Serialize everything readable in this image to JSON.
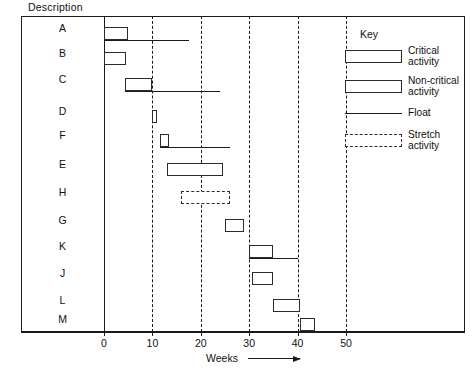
{
  "header": {
    "description_label": "Description"
  },
  "axis": {
    "x_title": "Weeks",
    "ticks": [
      {
        "value": 0,
        "label": "0"
      },
      {
        "value": 10,
        "label": "10"
      },
      {
        "value": 20,
        "label": "20"
      },
      {
        "value": 30,
        "label": "30"
      },
      {
        "value": 40,
        "label": "40"
      },
      {
        "value": 50,
        "label": "50"
      }
    ]
  },
  "key": {
    "title": "Key",
    "items": [
      {
        "type": "critical",
        "label": "Critical\nactivity"
      },
      {
        "type": "non-critical",
        "label": "Non-critical\nactivity"
      },
      {
        "type": "float",
        "label": "Float"
      },
      {
        "type": "stretch",
        "label": "Stretch\nactivity"
      }
    ],
    "item_labels": {
      "critical_line1": "Critical",
      "critical_line2": "activity",
      "noncritical_line1": "Non-critical",
      "noncritical_line2": "activity",
      "float_line1": "Float",
      "stretch_line1": "Stretch",
      "stretch_line2": "activity"
    }
  },
  "chart_data": {
    "type": "bar",
    "orientation": "horizontal",
    "subtype": "gantt",
    "title": "",
    "xlabel": "Weeks",
    "ylabel": "Description",
    "xlim": [
      0,
      57
    ],
    "grid": "vertical-dashed",
    "gridlines": [
      10,
      20,
      30,
      40,
      50
    ],
    "legend_position": "right-inside",
    "categories": [
      "A",
      "B",
      "C",
      "D",
      "F",
      "E",
      "H",
      "G",
      "K",
      "J",
      "L",
      "M"
    ],
    "bars": [
      {
        "label": "A",
        "start": 0,
        "end": 5,
        "kind": "critical",
        "float_end": 17.5
      },
      {
        "label": "B",
        "start": 0,
        "end": 4.5,
        "kind": "critical",
        "float_end": null
      },
      {
        "label": "C",
        "start": 4.3,
        "end": 10,
        "kind": "non-critical",
        "float_end": 24.0
      },
      {
        "label": "D",
        "start": 10,
        "end": 11,
        "kind": "non-critical",
        "float_end": null
      },
      {
        "label": "F",
        "start": 11.5,
        "end": 13.5,
        "kind": "non-critical",
        "float_end": 26.0
      },
      {
        "label": "E",
        "start": 13,
        "end": 24.5,
        "kind": "non-critical",
        "float_end": null
      },
      {
        "label": "H",
        "start": 16,
        "end": 26,
        "kind": "stretch",
        "float_end": null
      },
      {
        "label": "G",
        "start": 25,
        "end": 29,
        "kind": "non-critical",
        "float_end": null
      },
      {
        "label": "K",
        "start": 30,
        "end": 35,
        "kind": "non-critical",
        "float_end": 40.0
      },
      {
        "label": "J",
        "start": 30.5,
        "end": 35,
        "kind": "non-critical",
        "float_end": null
      },
      {
        "label": "L",
        "start": 35,
        "end": 40.5,
        "kind": "non-critical",
        "float_end": null
      },
      {
        "label": "M",
        "start": 40.5,
        "end": 43.5,
        "kind": "non-critical",
        "float_end": null
      }
    ]
  },
  "geometry": {
    "px_per_week": 4.84,
    "row_y": [
      27,
      52,
      78,
      110,
      134,
      163,
      191,
      219,
      245,
      272,
      299,
      318
    ]
  }
}
